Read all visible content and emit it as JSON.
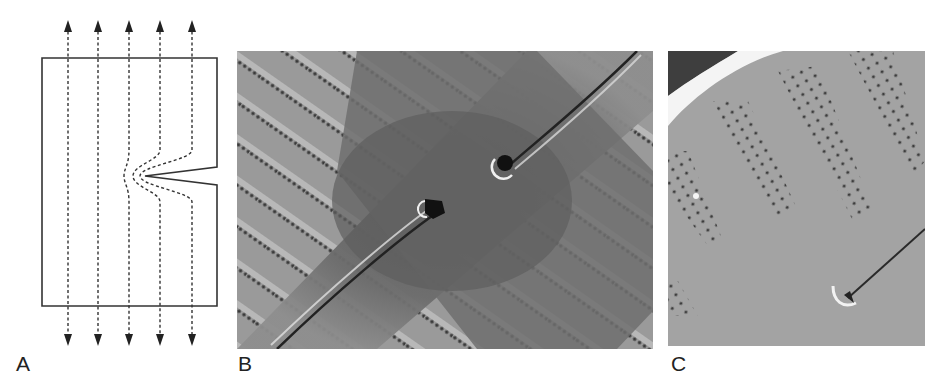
{
  "figure": {
    "panels": [
      {
        "id": "A",
        "label": "A",
        "kind": "schematic",
        "description": "Plate with edge notch; dashed flow/stress lines with arrows deflecting around notch tip"
      },
      {
        "id": "B",
        "label": "B",
        "kind": "micrograph",
        "description": "SEM of diatom valve center with two opposing raphe slits and rows of areolae"
      },
      {
        "id": "C",
        "label": "C",
        "kind": "micrograph",
        "description": "SEM of valve margin with curved rows of pores and raphe terminal end"
      }
    ],
    "panel_a": {
      "arrow_count": 5,
      "arrow_x": [
        68,
        98,
        129,
        160,
        192
      ],
      "notch_side": "right"
    },
    "colors": {
      "line": "#333333",
      "sem_dark": "#5a5a5a",
      "sem_mid": "#8a8a8a",
      "sem_light": "#b8b8b8"
    }
  }
}
